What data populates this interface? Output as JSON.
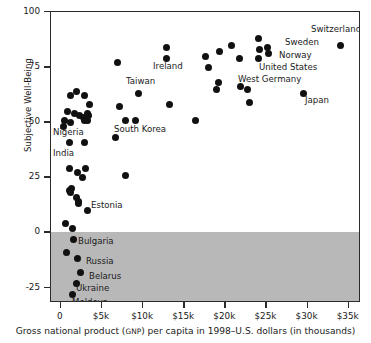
{
  "chart_data": {
    "type": "scatter",
    "title": "",
    "xlabel_parts": {
      "pre": "Gross national product (",
      "smallcaps": "GNP",
      "post": ") per capita in 1998–U.S. dollars (in thousands)"
    },
    "xlabel": "Gross national product (GNP) per capita in 1998–U.S. dollars (in thousands)",
    "ylabel": "Subjective Well-Being",
    "xlim": [
      -1200,
      36500
    ],
    "ylim": [
      -32,
      100
    ],
    "xticks": [
      0,
      5000,
      10000,
      15000,
      20000,
      25000,
      30000,
      35000
    ],
    "xticklabels": [
      "0",
      "$5k",
      "$10k",
      "$15k",
      "$20k",
      "$25k",
      "$30k",
      "$35k"
    ],
    "yticks": [
      -25,
      0,
      25,
      50,
      75,
      100
    ],
    "yticklabels": [
      "-25",
      "0",
      "25",
      "50",
      "75",
      "100"
    ],
    "grid": false,
    "legend": false,
    "shaded_region": {
      "label": "negative subjective well-being band",
      "y_from": -32,
      "y_to": 0,
      "color": "#b8b8b8"
    },
    "marker_color": "#111111",
    "points": [
      {
        "x": 1200,
        "y": 62
      },
      {
        "x": 1900,
        "y": 64
      },
      {
        "x": 800,
        "y": 55
      },
      {
        "x": 2900,
        "y": 62
      },
      {
        "x": 400,
        "y": 51
      },
      {
        "x": 1700,
        "y": 54
      },
      {
        "x": 2300,
        "y": 53
      },
      {
        "x": 3500,
        "y": 58
      },
      {
        "x": 1200,
        "y": 50
      },
      {
        "x": 2800,
        "y": 52
      },
      {
        "x": 3200,
        "y": 54
      },
      {
        "x": 3300,
        "y": 53
      },
      {
        "x": 2900,
        "y": 51
      },
      {
        "x": 3200,
        "y": 51
      },
      {
        "x": 300,
        "y": 48
      },
      {
        "x": 1100,
        "y": 41
      },
      {
        "x": 2900,
        "y": 41
      },
      {
        "x": 1100,
        "y": 29
      },
      {
        "x": 2000,
        "y": 27
      },
      {
        "x": 3000,
        "y": 29
      },
      {
        "x": 2600,
        "y": 25
      },
      {
        "x": 1100,
        "y": 19
      },
      {
        "x": 1300,
        "y": 20
      },
      {
        "x": 1200,
        "y": 18
      },
      {
        "x": 1900,
        "y": 16
      },
      {
        "x": 2100,
        "y": 14
      },
      {
        "x": 2100,
        "y": 13
      },
      {
        "x": 3200,
        "y": 10
      },
      {
        "x": 600,
        "y": 4
      },
      {
        "x": 1400,
        "y": 2
      },
      {
        "x": 1500,
        "y": -3
      },
      {
        "x": 700,
        "y": -9
      },
      {
        "x": 2000,
        "y": -12
      },
      {
        "x": 2400,
        "y": -18
      },
      {
        "x": 1900,
        "y": -23
      },
      {
        "x": 1400,
        "y": -28
      },
      {
        "x": 6900,
        "y": 77
      },
      {
        "x": 7100,
        "y": 57
      },
      {
        "x": 6600,
        "y": 43
      },
      {
        "x": 7900,
        "y": 51
      },
      {
        "x": 9100,
        "y": 51
      },
      {
        "x": 7900,
        "y": 26
      },
      {
        "x": 9400,
        "y": 63
      },
      {
        "x": 12800,
        "y": 84
      },
      {
        "x": 12800,
        "y": 79
      },
      {
        "x": 13200,
        "y": 58
      },
      {
        "x": 16400,
        "y": 51
      },
      {
        "x": 17600,
        "y": 80
      },
      {
        "x": 18000,
        "y": 75
      },
      {
        "x": 19300,
        "y": 82
      },
      {
        "x": 19200,
        "y": 68
      },
      {
        "x": 18900,
        "y": 65
      },
      {
        "x": 20700,
        "y": 85
      },
      {
        "x": 21700,
        "y": 79
      },
      {
        "x": 21800,
        "y": 66
      },
      {
        "x": 22700,
        "y": 65
      },
      {
        "x": 23000,
        "y": 59
      },
      {
        "x": 24000,
        "y": 88
      },
      {
        "x": 24100,
        "y": 83
      },
      {
        "x": 24000,
        "y": 79
      },
      {
        "x": 25100,
        "y": 84
      },
      {
        "x": 25300,
        "y": 81
      },
      {
        "x": 29500,
        "y": 63
      },
      {
        "x": 34000,
        "y": 85
      }
    ],
    "annotations": [
      {
        "label": "Switzerland",
        "x": 310,
        "y": 24
      },
      {
        "label": "Sweden",
        "x": 284,
        "y": 37
      },
      {
        "label": "Norway",
        "x": 278,
        "y": 50
      },
      {
        "label": "United States",
        "x": 258,
        "y": 62
      },
      {
        "label": "West Germany",
        "x": 237,
        "y": 74
      },
      {
        "label": "Japan",
        "x": 304,
        "y": 95
      },
      {
        "label": "Ireland",
        "x": 152,
        "y": 61
      },
      {
        "label": "Taiwan",
        "x": 125,
        "y": 76
      },
      {
        "label": "South Korea",
        "x": 113,
        "y": 124
      },
      {
        "label": "Nigeria",
        "x": 52,
        "y": 127
      },
      {
        "label": "India",
        "x": 52,
        "y": 148
      },
      {
        "label": "Estonia",
        "x": 90,
        "y": 200
      },
      {
        "label": "Bulgaria",
        "x": 77,
        "y": 236
      },
      {
        "label": "Russia",
        "x": 85,
        "y": 256
      },
      {
        "label": "Belarus",
        "x": 88,
        "y": 271
      },
      {
        "label": "Ukraine",
        "x": 75,
        "y": 283
      },
      {
        "label": "Moldova",
        "x": 71,
        "y": 297
      }
    ]
  }
}
